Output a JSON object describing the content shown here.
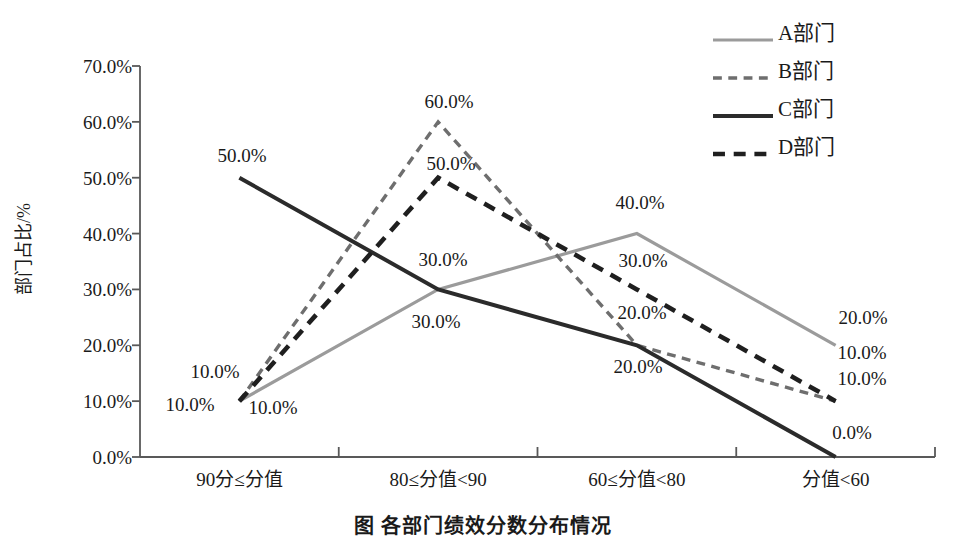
{
  "chart_data": {
    "type": "line",
    "title": "",
    "xlabel": "",
    "ylabel": "部门占比/%",
    "categories": [
      "90分≤分值",
      "80≤分值<90",
      "60≤分值<80",
      "分值<60"
    ],
    "ylim": [
      0,
      70
    ],
    "ytick_labels": [
      "0.0%",
      "10.0%",
      "20.0%",
      "30.0%",
      "40.0%",
      "50.0%",
      "60.0%",
      "70.0%"
    ],
    "ytick_values": [
      0,
      10,
      20,
      30,
      40,
      50,
      60,
      70
    ],
    "grid": false,
    "legend_position": "top-right",
    "series": [
      {
        "name": "A部门",
        "values": [
          10,
          30,
          40,
          20
        ],
        "labels": [
          "10.0%",
          "30.0%",
          "40.0%",
          "20.0%"
        ],
        "color": "#9b9b9b",
        "style": "solid",
        "width": 3.2
      },
      {
        "name": "B部门",
        "values": [
          10,
          60,
          20,
          10
        ],
        "labels": [
          "10.0%",
          "60.0%",
          "20.0%",
          "10.0%"
        ],
        "color": "#6e6e6e",
        "style": "dashed",
        "width": 3.4
      },
      {
        "name": "C部门",
        "values": [
          50,
          30,
          20,
          0
        ],
        "labels": [
          "50.0%",
          "30.0%",
          "20.0%",
          "0.0%"
        ],
        "color": "#2b2b2b",
        "style": "solid",
        "width": 4.0
      },
      {
        "name": "D部门",
        "values": [
          10,
          50,
          30,
          10
        ],
        "labels": [
          "10.0%",
          "50.0%",
          "30.0%",
          "10.0%"
        ],
        "color": "#1f1f1f",
        "style": "dashed",
        "width": 4.6
      }
    ],
    "point_labels": [
      {
        "text": "50.0%",
        "x": 242,
        "y": 155
      },
      {
        "text": "10.0%",
        "x": 215,
        "y": 371
      },
      {
        "text": "10.0%",
        "x": 190,
        "y": 404
      },
      {
        "text": "10.0%",
        "x": 273,
        "y": 407
      },
      {
        "text": "60.0%",
        "x": 449,
        "y": 101
      },
      {
        "text": "50.0%",
        "x": 451,
        "y": 163
      },
      {
        "text": "30.0%",
        "x": 443,
        "y": 259
      },
      {
        "text": "30.0%",
        "x": 436,
        "y": 321
      },
      {
        "text": "40.0%",
        "x": 640,
        "y": 202
      },
      {
        "text": "30.0%",
        "x": 643,
        "y": 260
      },
      {
        "text": "20.0%",
        "x": 642,
        "y": 312
      },
      {
        "text": "20.0%",
        "x": 638,
        "y": 366
      },
      {
        "text": "20.0%",
        "x": 863,
        "y": 317
      },
      {
        "text": "10.0%",
        "x": 862,
        "y": 352
      },
      {
        "text": "10.0%",
        "x": 862,
        "y": 378
      },
      {
        "text": "0.0%",
        "x": 852,
        "y": 432
      }
    ],
    "axis_color": "#595959"
  },
  "caption": {
    "text": "图 各部门绩效分数分布情况"
  }
}
